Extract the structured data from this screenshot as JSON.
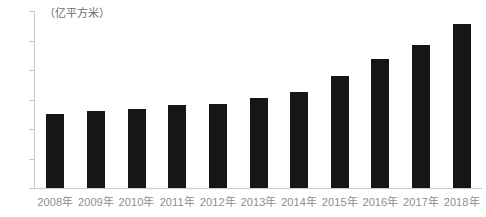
{
  "chart_data": {
    "type": "bar",
    "title": "",
    "subtitle": "",
    "unit_caption": "（亿平方米）",
    "xlabel": "",
    "ylabel": "",
    "ylim": [
      0,
      300
    ],
    "yticks": [
      0,
      50,
      100,
      150,
      200,
      250,
      300
    ],
    "ytick_labels": [
      "0",
      "50",
      "100",
      "150",
      "200",
      "250",
      "300"
    ],
    "grid": false,
    "legend": null,
    "bar_color": "#161616",
    "axis_color": "#c9c9c9",
    "tick_text_color": "#8d8d8d",
    "categories": [
      "2008年",
      "2009年",
      "2010年",
      "2011年",
      "2012年",
      "2013年",
      "2014年",
      "2015年",
      "2016年",
      "2017年",
      "2018年"
    ],
    "values": [
      125,
      130,
      134,
      141,
      143,
      152,
      162,
      190,
      218,
      242,
      278
    ]
  }
}
